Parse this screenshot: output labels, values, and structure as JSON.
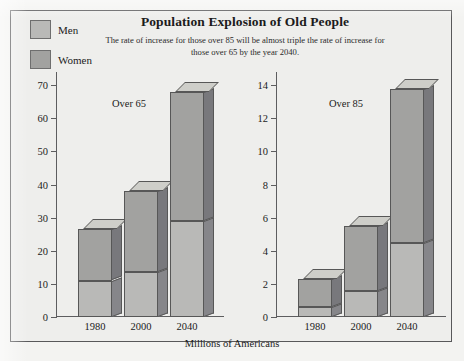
{
  "title": "Population Explosion of Old People",
  "subtitle": "The rate of increase for those over 85 will be almost triple the rate of increase for those over 65 by the year 2040.",
  "xlabel": "Millions of Americans",
  "legend": [
    {
      "label": "Men",
      "color": "#b9b9b7"
    },
    {
      "label": "Women",
      "color": "#a2a2a0"
    }
  ],
  "panels": [
    {
      "note": "Over 65",
      "categories": [
        "1980",
        "2000",
        "2040"
      ],
      "ticks": [
        0,
        10,
        20,
        30,
        40,
        50,
        60,
        70
      ],
      "ymax": 74
    },
    {
      "note": "Over 85",
      "categories": [
        "1980",
        "2000",
        "2040"
      ],
      "ticks": [
        0,
        2,
        4,
        6,
        8,
        10,
        12,
        14
      ],
      "ymax": 14.8
    }
  ],
  "chart_data": [
    {
      "type": "bar",
      "title": "Over 65",
      "categories": [
        "1980",
        "2000",
        "2040"
      ],
      "series": [
        {
          "name": "Men",
          "values": [
            11,
            13.5,
            29
          ]
        },
        {
          "name": "Women",
          "values": [
            15.5,
            24.5,
            39
          ]
        }
      ],
      "totals": [
        26.5,
        38,
        68
      ],
      "stacked": true,
      "xlabel": "Millions of Americans",
      "ylabel": "",
      "ylim": [
        0,
        74
      ],
      "yticks": [
        0,
        10,
        20,
        30,
        40,
        50,
        60,
        70
      ],
      "grid": false
    },
    {
      "type": "bar",
      "title": "Over 85",
      "categories": [
        "1980",
        "2000",
        "2040"
      ],
      "series": [
        {
          "name": "Men",
          "values": [
            0.6,
            1.6,
            4.5
          ]
        },
        {
          "name": "Women",
          "values": [
            1.7,
            3.9,
            9.3
          ]
        }
      ],
      "totals": [
        2.3,
        5.5,
        13.8
      ],
      "stacked": true,
      "xlabel": "Millions of Americans",
      "ylabel": "",
      "ylim": [
        0,
        14.8
      ],
      "yticks": [
        0,
        2,
        4,
        6,
        8,
        10,
        12,
        14
      ],
      "grid": false
    }
  ]
}
